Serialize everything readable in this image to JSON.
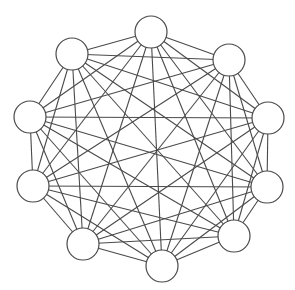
{
  "diagram": {
    "type": "complete-graph",
    "name": "K10",
    "node_count": 10,
    "node_radius": 16,
    "colors": {
      "stroke": "#4a4a4a",
      "fill": "#ffffff",
      "background": "#ffffff"
    },
    "nodes": [
      {
        "id": 0,
        "x": 151,
        "y": 32
      },
      {
        "id": 1,
        "x": 229,
        "y": 60
      },
      {
        "id": 2,
        "x": 268,
        "y": 118
      },
      {
        "id": 3,
        "x": 267,
        "y": 187
      },
      {
        "id": 4,
        "x": 234,
        "y": 236
      },
      {
        "id": 5,
        "x": 162,
        "y": 266
      },
      {
        "id": 6,
        "x": 83,
        "y": 244
      },
      {
        "id": 7,
        "x": 33,
        "y": 186
      },
      {
        "id": 8,
        "x": 30,
        "y": 117
      },
      {
        "id": 9,
        "x": 72,
        "y": 54
      }
    ],
    "edges": "all-pairs"
  }
}
